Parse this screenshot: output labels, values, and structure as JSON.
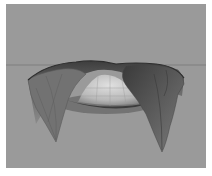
{
  "render": {
    "description": "Grayscale 3D render of a draped cloth surface hanging over a sphere against a flat gray background",
    "background_color": "#9a9a9a",
    "horizon_color": "#8c8c8c",
    "cloth_dark_color": "#4a4a4a",
    "cloth_mid_color": "#6e6e6e",
    "sphere_color": "#c8c8c8",
    "caption": ""
  }
}
